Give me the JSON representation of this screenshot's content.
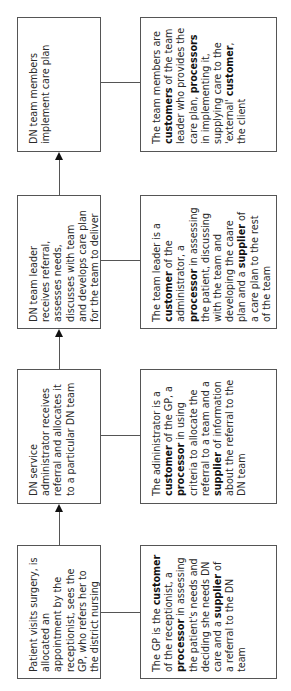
{
  "diagram": {
    "orientation": "rotated-90-ccw",
    "steps": [
      {
        "process": "Patient visits surgery, is allocated an appointment by the receptionist, sees the GP, who refers her to the district nursing service",
        "role": [
          {
            "t": "The GP is the ",
            "b": false
          },
          {
            "t": "customer",
            "b": true
          },
          {
            "t": " of the receptionist, a ",
            "b": false
          },
          {
            "t": "processor",
            "b": true
          },
          {
            "t": " in assessing the patient's needs and deciding she needs DN care and a ",
            "b": false
          },
          {
            "t": "supplier",
            "b": true
          },
          {
            "t": " of a referral to the DN team",
            "b": false
          }
        ]
      },
      {
        "process": "DN service administrator receives referral and allocates it to a particular DN team",
        "role": [
          {
            "t": "The adininistrator is a ",
            "b": false
          },
          {
            "t": "customer",
            "b": true
          },
          {
            "t": " of the GP, a ",
            "b": false
          },
          {
            "t": "processor",
            "b": true
          },
          {
            "t": " in using criteria to allocate the referral to a team and a ",
            "b": false
          },
          {
            "t": "supplier",
            "b": true
          },
          {
            "t": " of information about the referral to the DN team",
            "b": false
          }
        ]
      },
      {
        "process": "DN team leader receives referral, assesses needs, discusses with team and develops care plan for the team to deliver",
        "role": [
          {
            "t": "The team leader is a ",
            "b": false
          },
          {
            "t": "customer",
            "b": true
          },
          {
            "t": " of the administrator, a ",
            "b": false
          },
          {
            "t": "processor",
            "b": true
          },
          {
            "t": " in assessing the patient, discussing with the team and developing the caare plan and a ",
            "b": false
          },
          {
            "t": "supplier",
            "b": true
          },
          {
            "t": " of a care plan to the rest of the team",
            "b": false
          }
        ]
      },
      {
        "process": "DN team members implement care plan",
        "role": [
          {
            "t": "The team members are ",
            "b": false
          },
          {
            "t": "customers",
            "b": true
          },
          {
            "t": " of the team leader who provides the care plan, ",
            "b": false
          },
          {
            "t": "processors",
            "b": true
          },
          {
            "t": " in implementing it, supplying care to the 'external' ",
            "b": false
          },
          {
            "t": "customer",
            "b": true
          },
          {
            "t": ", the client",
            "b": false
          }
        ]
      }
    ],
    "colors": {
      "border": "#555555",
      "text": "#2a2a2a",
      "arrow": "#111111"
    }
  }
}
